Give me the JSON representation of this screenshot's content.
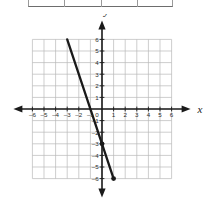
{
  "table_fragment": {
    "name": "partial-table",
    "cells": 4,
    "divider_positions_pct": [
      25,
      50,
      75
    ],
    "border_color": "#9a9a9a"
  },
  "chart_data": {
    "type": "line",
    "title": "",
    "xlabel": "x",
    "ylabel": "y",
    "xlim": [
      -6,
      6
    ],
    "ylim": [
      -6,
      6
    ],
    "xticks": [
      -6,
      -5,
      -4,
      -3,
      -2,
      -1,
      1,
      2,
      3,
      4,
      5,
      6
    ],
    "yticks": [
      6,
      5,
      4,
      3,
      2,
      1,
      -1,
      -2,
      -3,
      -4,
      -5,
      -6
    ],
    "origin_label": "0",
    "grid": true,
    "grid_color": "#b9b9b9",
    "axis_color": "#1a1a1a",
    "legend": "none",
    "series": [
      {
        "name": "line",
        "color": "#1a1a1a",
        "slope": -3,
        "intercept": -3,
        "equation": "y = -3x - 3",
        "x": [
          -3,
          1
        ],
        "y": [
          6,
          -6
        ],
        "points": [
          {
            "x": 0,
            "y": -3,
            "marker": "filled-dot"
          },
          {
            "x": 1,
            "y": -6,
            "marker": "filled-dot"
          }
        ]
      }
    ]
  }
}
